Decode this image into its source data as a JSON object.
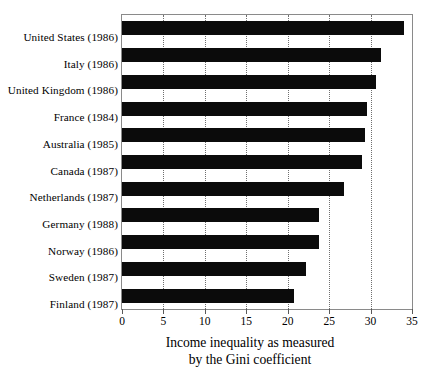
{
  "chart_data": {
    "type": "bar",
    "orientation": "horizontal",
    "title": "",
    "xlabel": "Income inequality as measured by the Gini coefficient",
    "xlabel_lines": [
      "Income inequality as measured",
      "by the Gini coefficient"
    ],
    "ylabel": "",
    "categories": [
      "United States (1986)",
      "Italy (1986)",
      "United Kingdom (1986)",
      "France (1984)",
      "Australia (1985)",
      "Canada (1987)",
      "Netherlands (1987)",
      "Germany (1988)",
      "Norway (1986)",
      "Sweden (1987)",
      "Finland (1987)"
    ],
    "values": [
      34.0,
      31.2,
      30.6,
      29.6,
      29.3,
      29.0,
      26.8,
      23.8,
      23.8,
      22.2,
      20.8
    ],
    "xlim": [
      0,
      35
    ],
    "xticks": [
      0,
      5,
      10,
      15,
      20,
      25,
      30,
      35
    ],
    "xticklabels": [
      "0",
      "5",
      "10",
      "15",
      "20",
      "25",
      "30",
      "35"
    ],
    "gridlines": [
      5,
      10,
      15,
      20,
      25,
      30
    ],
    "grid": true,
    "grid_axis": "x",
    "grid_style": "dotted",
    "legend": null,
    "bar_color": "#0b0b0b",
    "frame_color": "#8a8a8a",
    "background": "#ffffff"
  }
}
